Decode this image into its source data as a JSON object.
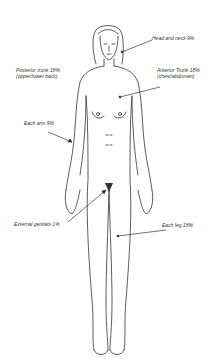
{
  "diagram": {
    "type": "body-surface-area-rule-of-nines",
    "labels": {
      "head_neck": "Head and neck 9%",
      "posterior_trunk_line1": "Posterior trunk 18%",
      "posterior_trunk_line2": "(upper/lower back)",
      "anterior_trunk_line1": "Anterior Trunk 18%",
      "anterior_trunk_line2": "(chest/abdomen)",
      "each_arm": "Each arm 9%",
      "external_genitals": "External genitals 1%",
      "each_leg": "Each leg 18%"
    },
    "colors": {
      "line": "#333333",
      "background": "#ffffff"
    }
  }
}
